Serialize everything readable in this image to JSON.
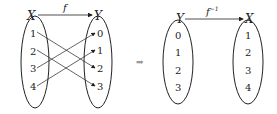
{
  "left_diagram": {
    "function_label": "f",
    "domain": {
      "label": "X",
      "elements": [
        "1",
        "2",
        "3",
        "4"
      ]
    },
    "codomain": {
      "label": "Y",
      "elements": [
        "0",
        "1",
        "2",
        "3"
      ]
    },
    "mappings": [
      {
        "from": "1",
        "to": "2"
      },
      {
        "from": "2",
        "to": "3"
      },
      {
        "from": "3",
        "to": "0"
      },
      {
        "from": "4",
        "to": "1"
      }
    ]
  },
  "implies_arrow": "➡",
  "right_diagram": {
    "function_label": "f",
    "function_superscript": "−1",
    "domain": {
      "label": "Y",
      "elements": [
        "0",
        "1",
        "2",
        "3"
      ]
    },
    "codomain": {
      "label": "X",
      "elements": [
        "1",
        "2",
        "3",
        "4"
      ]
    }
  },
  "colors": {
    "stroke": "#222222",
    "arrow": "#9a9a9a"
  }
}
